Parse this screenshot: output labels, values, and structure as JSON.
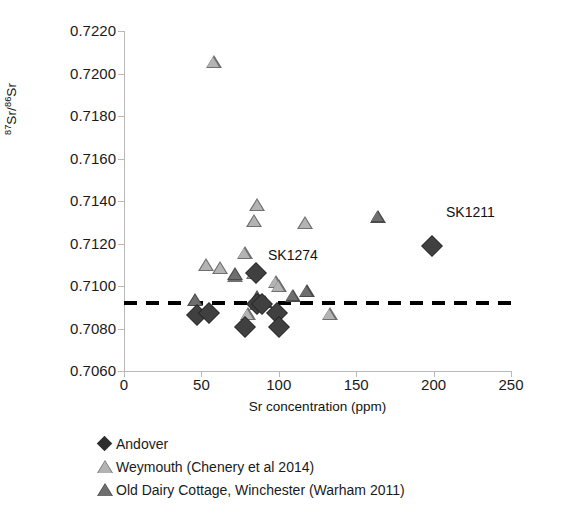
{
  "chart_data": {
    "type": "scatter",
    "title": "",
    "xlabel": "Sr concentration (ppm)",
    "ylabel": "87Sr/86Sr",
    "ylabel_parts": {
      "sup1": "87",
      "mid": "Sr/",
      "sup2": "86",
      "tail": "Sr"
    },
    "xlim": [
      0,
      250
    ],
    "ylim": [
      0.706,
      0.722
    ],
    "xticks": [
      0,
      50,
      100,
      150,
      200,
      250
    ],
    "xtick_labels": [
      "0",
      "50",
      "100",
      "150",
      "200",
      "250"
    ],
    "yticks": [
      0.706,
      0.708,
      0.71,
      0.712,
      0.714,
      0.716,
      0.718,
      0.72,
      0.722
    ],
    "ytick_labels": [
      "0.7060",
      "0.7080",
      "0.7100",
      "0.7120",
      "0.7140",
      "0.7160",
      "0.7180",
      "0.7200",
      "0.7220"
    ],
    "grid": false,
    "legend_position": "below",
    "reference_line": {
      "y": 0.7092,
      "style": "dashed",
      "color": "#000000"
    },
    "series": [
      {
        "name": "Andover",
        "marker": "diamond",
        "color": "#404040",
        "points": [
          {
            "x": 47,
            "y": 0.70862
          },
          {
            "x": 55,
            "y": 0.70871
          },
          {
            "x": 78,
            "y": 0.70805
          },
          {
            "x": 85,
            "y": 0.71063
          },
          {
            "x": 86,
            "y": 0.70917
          },
          {
            "x": 89,
            "y": 0.70914
          },
          {
            "x": 99,
            "y": 0.70871
          },
          {
            "x": 100,
            "y": 0.70806
          },
          {
            "x": 199,
            "y": 0.71188
          }
        ]
      },
      {
        "name": "Weymouth (Chenery et al 2014)",
        "marker": "triangle-light",
        "color": "#b3b3b3",
        "points": [
          {
            "x": 58,
            "y": 0.72048
          },
          {
            "x": 53,
            "y": 0.71092
          },
          {
            "x": 62,
            "y": 0.71076
          },
          {
            "x": 72,
            "y": 0.71042
          },
          {
            "x": 78,
            "y": 0.71148
          },
          {
            "x": 84,
            "y": 0.71053
          },
          {
            "x": 86,
            "y": 0.71374
          },
          {
            "x": 84,
            "y": 0.713
          },
          {
            "x": 80,
            "y": 0.7086
          },
          {
            "x": 86,
            "y": 0.7091
          },
          {
            "x": 98,
            "y": 0.7101
          },
          {
            "x": 100,
            "y": 0.70994
          },
          {
            "x": 117,
            "y": 0.71288
          },
          {
            "x": 133,
            "y": 0.70862
          }
        ]
      },
      {
        "name": "Old Dairy Cottage, Winchester (Warham 2011)",
        "marker": "triangle-dark",
        "color": "#6e6e6e",
        "points": [
          {
            "x": 46,
            "y": 0.70925
          },
          {
            "x": 72,
            "y": 0.71048
          },
          {
            "x": 86,
            "y": 0.7094
          },
          {
            "x": 88,
            "y": 0.70922
          },
          {
            "x": 91,
            "y": 0.70918
          },
          {
            "x": 109,
            "y": 0.70948
          },
          {
            "x": 118,
            "y": 0.70968
          },
          {
            "x": 164,
            "y": 0.7132
          }
        ]
      }
    ],
    "annotations": [
      {
        "label": "SK1274",
        "x": 93,
        "y": 0.71148
      },
      {
        "label": "SK1211",
        "x": 208,
        "y": 0.7135
      }
    ]
  },
  "legend": {
    "items": [
      {
        "label": "Andover",
        "glyph": "diamond-dark-icon"
      },
      {
        "label": "Weymouth (Chenery et al 2014)",
        "glyph": "triangle-light-icon"
      },
      {
        "label": "Old Dairy Cottage, Winchester (Warham 2011)",
        "glyph": "triangle-dark-icon"
      }
    ]
  }
}
